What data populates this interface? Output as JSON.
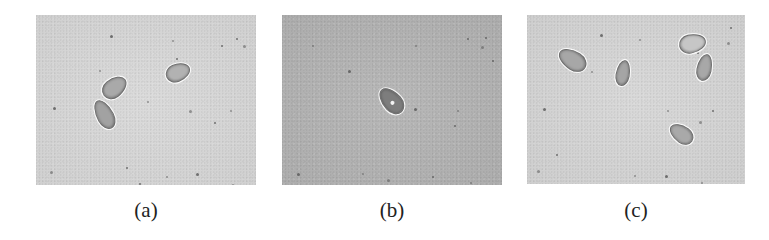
{
  "figure": {
    "panels": [
      {
        "id": "a",
        "label": "(a)",
        "box": {
          "x": 36,
          "y": 15,
          "w": 220,
          "h": 170
        },
        "background": "#d9d9d9",
        "cells": [
          {
            "x": 69,
            "y": 59,
            "w": 17,
            "h": 25,
            "rot": 52,
            "fill": "#a9a9a9"
          },
          {
            "x": 60,
            "y": 84,
            "w": 15,
            "h": 29,
            "rot": -28,
            "fill": "#a2a2a2"
          },
          {
            "x": 133,
            "y": 45,
            "w": 16,
            "h": 23,
            "rot": 68,
            "fill": "#b2b2b2"
          }
        ],
        "specks": [
          [
            74,
            20
          ],
          [
            136,
            25
          ],
          [
            200,
            23
          ],
          [
            207,
            30
          ],
          [
            185,
            30
          ],
          [
            63,
            55
          ],
          [
            17,
            92
          ],
          [
            194,
            95
          ],
          [
            178,
            107
          ],
          [
            153,
            95
          ],
          [
            90,
            152
          ],
          [
            130,
            161
          ],
          [
            160,
            158
          ],
          [
            196,
            169
          ],
          [
            103,
            168
          ],
          [
            14,
            156
          ],
          [
            140,
            43
          ],
          [
            111,
            86
          ]
        ]
      },
      {
        "id": "b",
        "label": "(b)",
        "box": {
          "x": 282,
          "y": 15,
          "w": 220,
          "h": 170
        },
        "background": "#b4b4b4",
        "cells": [
          {
            "x": 100,
            "y": 71,
            "w": 17,
            "h": 28,
            "rot": -42,
            "fill": "#7d7d7d",
            "spot": {
              "x": 8,
              "y": 16,
              "r": 4
            }
          }
        ],
        "specks": [
          [
            66,
            55
          ],
          [
            133,
            30
          ],
          [
            203,
            22
          ],
          [
            199,
            31
          ],
          [
            185,
            23
          ],
          [
            30,
            30
          ],
          [
            132,
            93
          ],
          [
            175,
            95
          ],
          [
            172,
            110
          ],
          [
            105,
            164
          ],
          [
            150,
            161
          ],
          [
            188,
            167
          ],
          [
            15,
            158
          ],
          [
            80,
            158
          ],
          [
            210,
            45
          ]
        ]
      },
      {
        "id": "c",
        "label": "(c)",
        "box": {
          "x": 527,
          "y": 15,
          "w": 218,
          "h": 169
        },
        "background": "#d7d7d7",
        "cells": [
          {
            "x": 36,
            "y": 30,
            "w": 17,
            "h": 28,
            "rot": -58,
            "fill": "#a7a7a7"
          },
          {
            "x": 89,
            "y": 45,
            "w": 12,
            "h": 24,
            "rot": 10,
            "fill": "#a5a5a5"
          },
          {
            "x": 156,
            "y": 15,
            "w": 17,
            "h": 25,
            "rot": 78,
            "fill": "#c6c6c6"
          },
          {
            "x": 170,
            "y": 39,
            "w": 13,
            "h": 25,
            "rot": 12,
            "fill": "#a8a8a8"
          },
          {
            "x": 146,
            "y": 106,
            "w": 15,
            "h": 24,
            "rot": -55,
            "fill": "#a9a9a9"
          }
        ],
        "specks": [
          [
            73,
            19
          ],
          [
            112,
            24
          ],
          [
            203,
            12
          ],
          [
            200,
            27
          ],
          [
            170,
            37
          ],
          [
            64,
            56
          ],
          [
            16,
            93
          ],
          [
            140,
            95
          ],
          [
            185,
            95
          ],
          [
            172,
            106
          ],
          [
            29,
            139
          ],
          [
            107,
            160
          ],
          [
            138,
            160
          ],
          [
            174,
            167
          ],
          [
            196,
            170
          ],
          [
            10,
            155
          ]
        ]
      }
    ]
  }
}
